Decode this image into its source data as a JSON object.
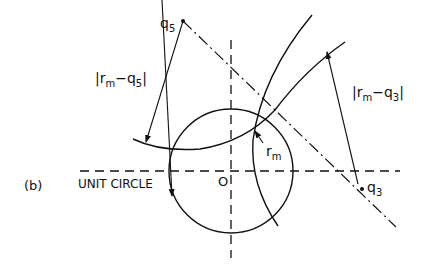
{
  "figure": {
    "panel_label": "(b)",
    "labels": {
      "q5": "q",
      "q5_sub": "5",
      "q3": "q",
      "q3_sub": "3",
      "rm": "r",
      "rm_sub": "m",
      "origin": "O",
      "unit_circle": "UNIT CIRCLE",
      "dist_q5_left": "|r",
      "dist_q5_sub": "m",
      "dist_q5_right": "−q",
      "dist_q5_sub2": "5",
      "dist_q5_close": "|",
      "dist_q3_left": "|r",
      "dist_q3_sub": "m",
      "dist_q3_right": "−q",
      "dist_q3_sub2": "3",
      "dist_q3_close": "|"
    },
    "colors": {
      "ink": "#111111",
      "background": "#ffffff"
    }
  }
}
